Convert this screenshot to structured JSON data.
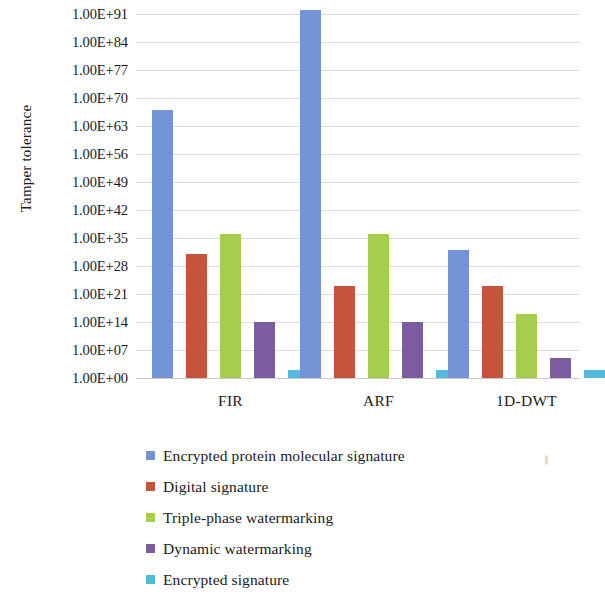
{
  "chart_data": {
    "type": "bar",
    "title": "",
    "xlabel": "",
    "ylabel": "Tamper tolerance",
    "categories": [
      "FIR",
      "ARF",
      "1D-DWT"
    ],
    "ytick_labels": [
      "1.00E+91",
      "1.00E+84",
      "1.00E+77",
      "1.00E+70",
      "1.00E+63",
      "1.00E+56",
      "1.00E+49",
      "1.00E+42",
      "1.00E+35",
      "1.00E+28",
      "1.00E+21",
      "1.00E+14",
      "1.00E+07",
      "1.00E+00"
    ],
    "ytick_exponents": [
      91,
      84,
      77,
      70,
      63,
      56,
      49,
      42,
      35,
      28,
      21,
      14,
      7,
      0
    ],
    "y_scale": "log",
    "ylim_exponents": [
      0,
      91
    ],
    "grid": true,
    "legend_position": "bottom",
    "series": [
      {
        "name": "Encrypted protein molecular signature",
        "color": "#7293D4",
        "exponents": [
          67,
          92,
          32
        ],
        "values": [
          "1E+67",
          "1E+92",
          "1E+32"
        ]
      },
      {
        "name": "Digital signature",
        "color": "#C5543A",
        "exponents": [
          31,
          23,
          23
        ],
        "values": [
          "1E+31",
          "1E+23",
          "1E+23"
        ]
      },
      {
        "name": "Triple-phase watermarking",
        "color": "#A5CE4E",
        "exponents": [
          36,
          36,
          16
        ],
        "values": [
          "1E+36",
          "1E+36",
          "1E+16"
        ]
      },
      {
        "name": "Dynamic watermarking",
        "color": "#7D5BA0",
        "exponents": [
          14,
          14,
          5
        ],
        "values": [
          "1E+14",
          "1E+14",
          "1E+05"
        ]
      },
      {
        "name": "Encrypted signature",
        "color": "#54B9DC",
        "exponents": [
          2,
          2,
          2
        ],
        "values": [
          "1E+02",
          "1E+02",
          "1E+02"
        ]
      }
    ]
  },
  "legend": {
    "items": [
      {
        "label": "Encrypted protein molecular signature",
        "color": "#7293D4"
      },
      {
        "label": "Digital signature",
        "color": "#C5543A"
      },
      {
        "label": "Triple-phase watermarking",
        "color": "#A5CE4E"
      },
      {
        "label": "Dynamic watermarking",
        "color": "#7D5BA0"
      },
      {
        "label": "Encrypted signature",
        "color": "#54B9DC"
      }
    ]
  }
}
